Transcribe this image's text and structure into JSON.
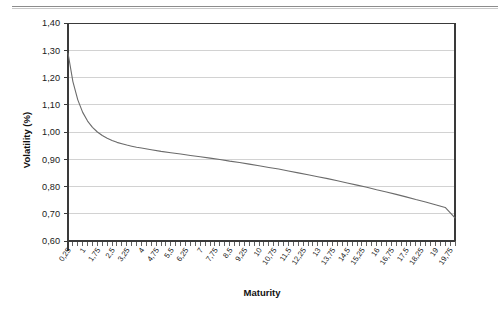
{
  "chart_data": {
    "type": "line",
    "title": "",
    "xlabel": "Maturity",
    "ylabel": "Volatility (%)",
    "xlim": [
      0.25,
      20
    ],
    "ylim": [
      0.6,
      1.4
    ],
    "grid": true,
    "legend": "none",
    "decimal_separator": ",",
    "y_ticks": [
      "0,60",
      "0,70",
      "0,80",
      "0,90",
      "1,00",
      "1,10",
      "1,20",
      "1,30",
      "1,40"
    ],
    "y_tick_values": [
      0.6,
      0.7,
      0.8,
      0.9,
      1.0,
      1.1,
      1.2,
      1.3,
      1.4
    ],
    "x_ticks": [
      "0,25",
      "1",
      "1,75",
      "2,5",
      "3,25",
      "4",
      "4,75",
      "5,5",
      "6,25",
      "7",
      "7,75",
      "8,5",
      "9,25",
      "10",
      "10,75",
      "11,5",
      "12,25",
      "13",
      "13,75",
      "14,5",
      "15,25",
      "16",
      "16,75",
      "17,5",
      "18,25",
      "19",
      "19,75"
    ],
    "x_tick_values": [
      0.25,
      1,
      1.75,
      2.5,
      3.25,
      4,
      4.75,
      5.5,
      6.25,
      7,
      7.75,
      8.5,
      9.25,
      10,
      10.75,
      11.5,
      12.25,
      13,
      13.75,
      14.5,
      15.25,
      16,
      16.75,
      17.5,
      18.25,
      19,
      19.75
    ],
    "series": [
      {
        "name": "Volatility term structure",
        "color": "#6b6b6b",
        "x": [
          0.25,
          0.5,
          0.75,
          1.0,
          1.25,
          1.5,
          1.75,
          2.0,
          2.25,
          2.5,
          2.75,
          3.0,
          3.25,
          3.5,
          3.75,
          4.0,
          4.5,
          5.0,
          5.5,
          6.0,
          6.5,
          7.0,
          7.5,
          8.0,
          8.5,
          9.0,
          9.5,
          10.0,
          10.5,
          11.0,
          11.5,
          12.0,
          12.5,
          13.0,
          13.5,
          14.0,
          14.5,
          15.0,
          15.5,
          16.0,
          16.5,
          17.0,
          17.5,
          18.0,
          18.5,
          19.0,
          19.5,
          20.0
        ],
        "y": [
          1.29,
          1.185,
          1.118,
          1.072,
          1.04,
          1.017,
          1.0,
          0.987,
          0.977,
          0.969,
          0.962,
          0.957,
          0.952,
          0.948,
          0.944,
          0.941,
          0.935,
          0.929,
          0.924,
          0.919,
          0.914,
          0.909,
          0.904,
          0.899,
          0.893,
          0.888,
          0.882,
          0.876,
          0.87,
          0.864,
          0.857,
          0.85,
          0.843,
          0.836,
          0.829,
          0.821,
          0.813,
          0.805,
          0.797,
          0.788,
          0.78,
          0.771,
          0.762,
          0.752,
          0.743,
          0.733,
          0.723,
          0.685
        ]
      }
    ]
  },
  "axes": {
    "x_title": "Maturity",
    "y_title": "Volatility (%)"
  }
}
